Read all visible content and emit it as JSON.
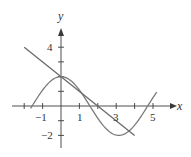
{
  "chart_data": {
    "type": "line",
    "title": "",
    "xlabel": "x",
    "ylabel": "y",
    "xlim": [
      -2.2,
      6.2
    ],
    "ylim": [
      -3.0,
      5.5
    ],
    "grid": false,
    "legend": null,
    "x_ticks": [
      -2,
      -1,
      0,
      1,
      2,
      3,
      4,
      5
    ],
    "x_tick_labels": [
      {
        "value": -1,
        "label": "−1"
      },
      {
        "value": 1,
        "label": "1"
      },
      {
        "value": 3,
        "label": "3"
      },
      {
        "value": 5,
        "label": "5"
      }
    ],
    "y_ticks": [
      -2,
      -1,
      1,
      2,
      3,
      4
    ],
    "y_tick_labels": [
      {
        "value": 4,
        "label": "4"
      },
      {
        "value": -2,
        "label": "−2"
      }
    ],
    "series": [
      {
        "name": "curve",
        "description": "y = 2cos(x)",
        "x_range": [
          -1.65,
          5.2
        ],
        "x": [
          -1.6,
          -1,
          0,
          1,
          1.57,
          2,
          3,
          3.14,
          4,
          4.71,
          5.2
        ],
        "y": [
          -0.06,
          1.08,
          2.0,
          1.08,
          0.0,
          -0.83,
          -1.98,
          -2.0,
          -1.31,
          0.0,
          0.94
        ]
      },
      {
        "name": "tangent line",
        "description": "y = 2 - x",
        "x_range": [
          -2.0,
          4.0
        ],
        "x": [
          -2,
          0,
          2,
          4
        ],
        "y": [
          4,
          2,
          0,
          -2
        ]
      }
    ],
    "colors": {
      "axis": "#3a3a3a",
      "curve": "#7a7a7a",
      "line": "#6a6a6a",
      "text": "#333333"
    }
  },
  "labels": {
    "x_axis": "x",
    "y_axis": "y",
    "x_ticks": [
      "−1",
      "1",
      "3",
      "5"
    ],
    "y_ticks": [
      "4",
      "−2"
    ]
  }
}
